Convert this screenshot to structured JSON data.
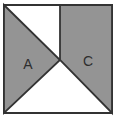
{
  "figure": {
    "background_color": "#ffffff",
    "outline_color": "#333333",
    "shaded_color": "#949494",
    "regions": [
      {
        "id": "left-triangle",
        "label": "A",
        "shape": "triangle",
        "shaded": true
      },
      {
        "id": "right-quadrilateral",
        "label": "C",
        "shape": "quadrilateral",
        "shaded": true
      }
    ]
  }
}
